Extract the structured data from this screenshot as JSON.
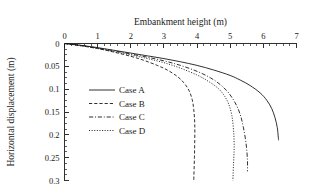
{
  "chart_data": {
    "type": "line",
    "title": "",
    "xlabel": "Embankment height (m)",
    "ylabel": "Horizontal displacement (m)",
    "xlim": [
      0,
      7
    ],
    "ylim": [
      0,
      0.3
    ],
    "y_inverted": true,
    "x_axis_position": "top",
    "grid": false,
    "legend_position": "center-left",
    "xticks": [
      0,
      1,
      2,
      3,
      4,
      5,
      6,
      7
    ],
    "xtick_labels": [
      "0",
      "1",
      "2",
      "3",
      "4",
      "5",
      "6",
      "7"
    ],
    "x_minor_tick_interval": 0.2,
    "yticks": [
      0,
      0.05,
      0.1,
      0.15,
      0.2,
      0.25,
      0.3
    ],
    "ytick_labels": [
      "0",
      "0.05",
      "0.1",
      "0.15",
      "0.2",
      "0.25",
      "0.3"
    ],
    "y_minor_tick_interval": 0.0125,
    "series": [
      {
        "name": "Case A",
        "linestyle": "solid",
        "color": "#1a1a1a",
        "points": [
          [
            0.0,
            0.0
          ],
          [
            0.5,
            0.004
          ],
          [
            1.0,
            0.009
          ],
          [
            1.5,
            0.015
          ],
          [
            2.0,
            0.021
          ],
          [
            2.5,
            0.027
          ],
          [
            3.0,
            0.033
          ],
          [
            3.5,
            0.04
          ],
          [
            4.0,
            0.048
          ],
          [
            4.5,
            0.058
          ],
          [
            5.0,
            0.07
          ],
          [
            5.3,
            0.08
          ],
          [
            5.6,
            0.092
          ],
          [
            5.9,
            0.108
          ],
          [
            6.1,
            0.124
          ],
          [
            6.25,
            0.142
          ],
          [
            6.35,
            0.162
          ],
          [
            6.42,
            0.184
          ],
          [
            6.45,
            0.205
          ],
          [
            6.46,
            0.212
          ]
        ]
      },
      {
        "name": "Case B",
        "linestyle": "dashed",
        "color": "#1a1a1a",
        "points": [
          [
            0.0,
            0.0
          ],
          [
            0.5,
            0.005
          ],
          [
            1.0,
            0.011
          ],
          [
            1.5,
            0.019
          ],
          [
            2.0,
            0.028
          ],
          [
            2.4,
            0.037
          ],
          [
            2.8,
            0.048
          ],
          [
            3.1,
            0.058
          ],
          [
            3.4,
            0.072
          ],
          [
            3.6,
            0.086
          ],
          [
            3.75,
            0.102
          ],
          [
            3.85,
            0.122
          ],
          [
            3.9,
            0.145
          ],
          [
            3.93,
            0.175
          ],
          [
            3.93,
            0.21
          ],
          [
            3.92,
            0.25
          ],
          [
            3.9,
            0.3
          ]
        ]
      },
      {
        "name": "Case C",
        "linestyle": "dashdot",
        "color": "#1a1a1a",
        "points": [
          [
            0.0,
            0.0
          ],
          [
            0.5,
            0.004
          ],
          [
            1.0,
            0.01
          ],
          [
            1.5,
            0.016
          ],
          [
            2.0,
            0.023
          ],
          [
            2.5,
            0.03
          ],
          [
            3.0,
            0.038
          ],
          [
            3.5,
            0.048
          ],
          [
            4.0,
            0.061
          ],
          [
            4.4,
            0.075
          ],
          [
            4.7,
            0.09
          ],
          [
            4.95,
            0.108
          ],
          [
            5.15,
            0.13
          ],
          [
            5.3,
            0.155
          ],
          [
            5.4,
            0.185
          ],
          [
            5.48,
            0.22
          ],
          [
            5.52,
            0.255
          ],
          [
            5.52,
            0.28
          ]
        ]
      },
      {
        "name": "Case D",
        "linestyle": "dotted",
        "color": "#1a1a1a",
        "points": [
          [
            0.0,
            0.0
          ],
          [
            0.5,
            0.005
          ],
          [
            1.0,
            0.011
          ],
          [
            1.5,
            0.018
          ],
          [
            2.0,
            0.025
          ],
          [
            2.5,
            0.033
          ],
          [
            3.0,
            0.042
          ],
          [
            3.5,
            0.054
          ],
          [
            4.0,
            0.069
          ],
          [
            4.3,
            0.081
          ],
          [
            4.6,
            0.096
          ],
          [
            4.8,
            0.112
          ],
          [
            4.95,
            0.132
          ],
          [
            5.05,
            0.158
          ],
          [
            5.1,
            0.19
          ],
          [
            5.12,
            0.225
          ],
          [
            5.1,
            0.262
          ],
          [
            5.08,
            0.3
          ]
        ]
      }
    ],
    "legend_entries": [
      {
        "label": "Case A",
        "linestyle": "solid"
      },
      {
        "label": "Case B",
        "linestyle": "dashed"
      },
      {
        "label": "Case C",
        "linestyle": "dashdot"
      },
      {
        "label": "Case D",
        "linestyle": "dotted"
      }
    ]
  }
}
